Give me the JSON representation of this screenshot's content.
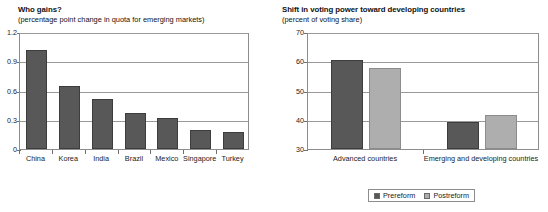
{
  "legend": {
    "items": [
      {
        "label": "Prereform",
        "color": "#585858",
        "key": "prereform"
      },
      {
        "label": "Postreform",
        "color": "#aeaeae",
        "key": "postreform"
      }
    ]
  },
  "chart_data": [
    {
      "id": "who-gains",
      "type": "bar",
      "title": "Who gains?",
      "subtitle": "(percentage point change in quota for emerging markets)",
      "xlabel": "",
      "ylabel": "",
      "ylim": [
        0,
        1.2
      ],
      "yticks": [
        0,
        0.3,
        0.6,
        0.9,
        1.2
      ],
      "ytick_labels": [
        "0",
        "0.3",
        "0.6",
        "0.9",
        "1.2"
      ],
      "grid": true,
      "legend_position": "none",
      "categories": [
        "China",
        "Korea",
        "India",
        "Brazil",
        "Mexico",
        "Singapore",
        "Turkey"
      ],
      "values": [
        1.02,
        0.65,
        0.51,
        0.37,
        0.32,
        0.19,
        0.17
      ],
      "series_color": "#585858"
    },
    {
      "id": "voting-power-shift",
      "type": "bar",
      "title": "Shift in voting power toward developing countries",
      "subtitle": "(percent of voting share)",
      "xlabel": "",
      "ylabel": "",
      "ylim": [
        30,
        70
      ],
      "yticks": [
        30,
        40,
        50,
        60,
        70
      ],
      "ytick_labels": [
        "30",
        "40",
        "50",
        "60",
        "70"
      ],
      "grid": true,
      "legend_position": "bottom",
      "categories": [
        "Advanced countries",
        "Emerging and developing countries"
      ],
      "series": [
        {
          "name": "Prereform",
          "values": [
            60.5,
            39.4
          ],
          "color": "#585858"
        },
        {
          "name": "Postreform",
          "values": [
            57.8,
            41.5
          ],
          "color": "#aeaeae"
        }
      ]
    }
  ]
}
